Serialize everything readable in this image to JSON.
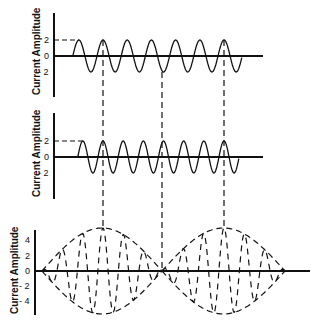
{
  "figure": {
    "line_color": "#111111",
    "panels": [
      {
        "id": "wave1",
        "ylabel": "Current Amplitude",
        "ticks": [
          {
            "label": "2",
            "value": 2
          },
          {
            "label": "0",
            "value": 0
          },
          {
            "label": "- 2",
            "value": -2
          }
        ],
        "amplitude": 2,
        "cycles": 7
      },
      {
        "id": "wave2",
        "ylabel": "Current Amplitude",
        "ticks": [
          {
            "label": "2",
            "value": 2
          },
          {
            "label": "0",
            "value": 0
          },
          {
            "label": "- 2",
            "value": -2
          }
        ],
        "amplitude": 2,
        "cycles": 8
      },
      {
        "id": "sum",
        "ylabel": "Current Amplitude",
        "ticks": [
          {
            "label": "4",
            "value": 4
          },
          {
            "label": "2",
            "value": 2
          },
          {
            "label": "0",
            "value": 0
          },
          {
            "label": "- 2",
            "value": -2
          },
          {
            "label": "- 4",
            "value": -4
          }
        ],
        "amplitude": 4,
        "beats": 2
      }
    ],
    "alignment_lines": 3
  }
}
